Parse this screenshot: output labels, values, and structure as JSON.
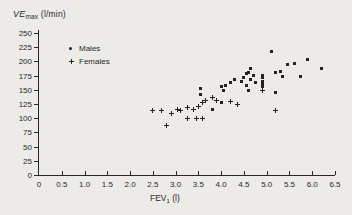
{
  "title": {
    "prefix": "VE",
    "subscript": "max",
    "suffix": " (l/min)"
  },
  "legend": {
    "males_label": "Males",
    "females_label": "Females"
  },
  "x_axis": {
    "label_main": "FEV",
    "label_sub": "1",
    "label_unit": " (l)",
    "tick_values": [
      0,
      0.5,
      1.0,
      1.5,
      2.0,
      2.5,
      3.0,
      3.5,
      4.0,
      4.5,
      5.0,
      5.5,
      6.0,
      6.5
    ],
    "tick_labels": [
      "0",
      "0.5",
      "1.0",
      "1.5",
      "2.0",
      "2.5",
      "3.0",
      "3.5",
      "4.0",
      "4.5",
      "5.0",
      "5.5",
      "6.0",
      "6.5"
    ]
  },
  "y_axis": {
    "tick_values": [
      0,
      25,
      50,
      75,
      100,
      125,
      150,
      175,
      200,
      225,
      250
    ],
    "tick_labels": [
      "0",
      "25",
      "50",
      "75",
      "100",
      "125",
      "150",
      "175",
      "200",
      "225",
      "250"
    ]
  },
  "colors": {
    "ink": "#2a2923",
    "background": "#ecebe8"
  },
  "chart_data": {
    "type": "scatter",
    "xlabel": "FEV1 (l)",
    "ylabel": "VEmax (l/min)",
    "xlim": [
      0,
      6.5
    ],
    "ylim": [
      0,
      250
    ],
    "grid": false,
    "legend_position": "upper-left-inside",
    "series": [
      {
        "name": "Males",
        "marker": "filled-square",
        "points": [
          [
            3.55,
            153
          ],
          [
            3.55,
            141
          ],
          [
            3.8,
            116
          ],
          [
            4.0,
            155
          ],
          [
            4.05,
            148
          ],
          [
            4.0,
            127
          ],
          [
            4.1,
            158
          ],
          [
            4.2,
            162
          ],
          [
            4.3,
            169
          ],
          [
            4.45,
            165
          ],
          [
            4.55,
            157
          ],
          [
            4.5,
            171
          ],
          [
            4.55,
            178
          ],
          [
            4.6,
            181
          ],
          [
            4.65,
            187
          ],
          [
            4.65,
            169
          ],
          [
            4.7,
            176
          ],
          [
            4.75,
            162
          ],
          [
            4.6,
            148
          ],
          [
            4.9,
            176
          ],
          [
            4.9,
            171
          ],
          [
            4.9,
            165
          ],
          [
            4.9,
            160
          ],
          [
            4.9,
            155
          ],
          [
            5.1,
            217
          ],
          [
            5.2,
            181
          ],
          [
            5.2,
            146
          ],
          [
            5.3,
            183
          ],
          [
            5.35,
            174
          ],
          [
            5.45,
            195
          ],
          [
            5.6,
            197
          ],
          [
            5.75,
            174
          ],
          [
            5.9,
            204
          ],
          [
            6.2,
            188
          ]
        ]
      },
      {
        "name": "Females",
        "marker": "plus",
        "points": [
          [
            2.5,
            113
          ],
          [
            2.7,
            114
          ],
          [
            2.8,
            88
          ],
          [
            2.9,
            109
          ],
          [
            3.05,
            116
          ],
          [
            3.1,
            113
          ],
          [
            3.25,
            118
          ],
          [
            3.25,
            100
          ],
          [
            3.4,
            116
          ],
          [
            3.45,
            99
          ],
          [
            3.5,
            120
          ],
          [
            3.6,
            128
          ],
          [
            3.6,
            100
          ],
          [
            3.65,
            132
          ],
          [
            3.8,
            137
          ],
          [
            3.9,
            132
          ],
          [
            4.2,
            130
          ],
          [
            4.35,
            125
          ],
          [
            4.9,
            148
          ],
          [
            5.2,
            114
          ]
        ]
      }
    ]
  }
}
